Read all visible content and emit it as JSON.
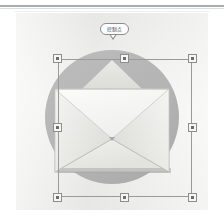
{
  "app": {
    "type": "vector-graphic-editor-canvas",
    "background_color": "#ffffff",
    "canvas_color": "#eeeeec"
  },
  "rules": {
    "primary_color": "#a9adb2",
    "secondary_color": "#dcdfe2",
    "tertiary_color": "#eceef0"
  },
  "artwork": {
    "name": "email-envelope-icon",
    "circle": {
      "fill": "#b5b5b5",
      "center_x": 96,
      "center_y": 104,
      "radius": 67
    },
    "envelope": {
      "body_fill": "#f2f2f0",
      "flap_fill": "#dcdcd8",
      "inner_flap_fill": "#e6e6e2",
      "outline": "#b9b9b4",
      "shadow": "#9e9e9e"
    }
  },
  "selection": {
    "label": "selection-bounding-box",
    "border_color": "#9a9a9a",
    "x": 42,
    "y": 46,
    "width": 134,
    "height": 138,
    "handles": [
      {
        "name": "handle-top-left",
        "position": "nw"
      },
      {
        "name": "handle-top-center",
        "position": "n"
      },
      {
        "name": "handle-top-right",
        "position": "ne"
      },
      {
        "name": "handle-middle-left",
        "position": "w"
      },
      {
        "name": "handle-middle-right",
        "position": "e"
      },
      {
        "name": "handle-bottom-left",
        "position": "sw"
      },
      {
        "name": "handle-bottom-center",
        "position": "s"
      },
      {
        "name": "handle-bottom-right",
        "position": "se"
      }
    ],
    "handle_fill": "#f6f6f6",
    "handle_border": "#8d8d8d",
    "handle_core": "#6d6d6d"
  },
  "callout": {
    "text": "控制点",
    "background": "#fdfdfd",
    "border_color": "#8c8c8c",
    "points_to": "handle-top-center"
  }
}
